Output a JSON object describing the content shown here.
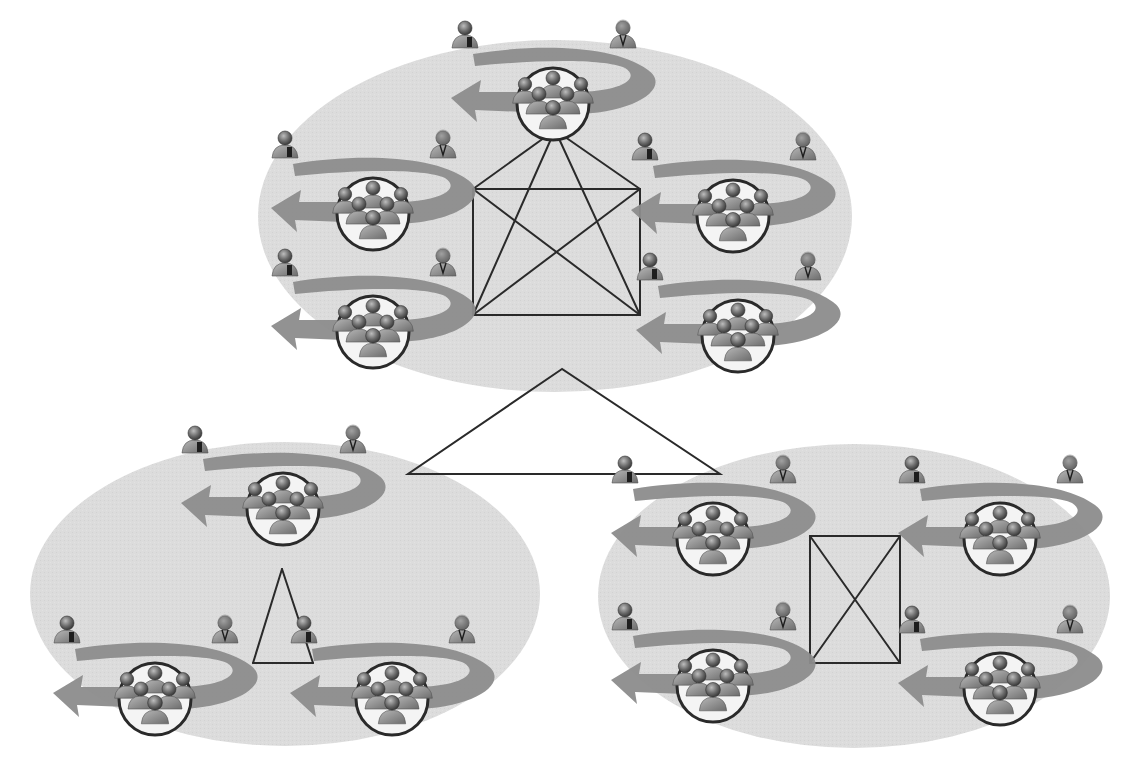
{
  "diagram": {
    "colors": {
      "background": "#ffffff",
      "cluster_fill": "#dcdcdc",
      "arrow": "#8c8c8c",
      "line": "#2a2a2a",
      "node_circle_fill": "#f4f4f4",
      "node_circle_stroke": "#2a2a2a",
      "person_body": "#9a9a9a",
      "person_head": "#6e6e6e"
    },
    "top_link": {
      "shape": "triangle",
      "points": [
        [
          562,
          369
        ],
        [
          408,
          474
        ],
        [
          720,
          474
        ]
      ]
    },
    "clusters": [
      {
        "id": "top-cluster",
        "ellipse": {
          "cx": 555,
          "cy": 216,
          "rx": 297,
          "ry": 176
        },
        "topology": "complete-graph-5",
        "nodes": [
          {
            "id": "T1",
            "cx": 553,
            "cy": 100
          },
          {
            "id": "T2",
            "cx": 373,
            "cy": 210
          },
          {
            "id": "T3",
            "cx": 733,
            "cy": 212
          },
          {
            "id": "T4",
            "cx": 373,
            "cy": 328
          },
          {
            "id": "T5",
            "cx": 738,
            "cy": 332
          }
        ],
        "lines": [
          [
            473,
            189,
            640,
            189
          ],
          [
            640,
            189,
            640,
            315
          ],
          [
            640,
            315,
            473,
            315
          ],
          [
            473,
            315,
            473,
            189
          ],
          [
            473,
            189,
            640,
            315
          ],
          [
            640,
            189,
            473,
            315
          ],
          [
            555,
            130,
            473,
            189
          ],
          [
            555,
            130,
            640,
            189
          ],
          [
            555,
            130,
            473,
            315
          ],
          [
            555,
            130,
            640,
            315
          ]
        ]
      },
      {
        "id": "bottom-left-cluster",
        "ellipse": {
          "cx": 285,
          "cy": 594,
          "rx": 255,
          "ry": 152
        },
        "topology": "triangle-3",
        "nodes": [
          {
            "id": "L1",
            "cx": 283,
            "cy": 505
          },
          {
            "id": "L2",
            "cx": 155,
            "cy": 695
          },
          {
            "id": "L3",
            "cx": 392,
            "cy": 695
          }
        ],
        "lines": [
          [
            282,
            569,
            253,
            663
          ],
          [
            253,
            663,
            313,
            663
          ],
          [
            313,
            663,
            282,
            569
          ]
        ]
      },
      {
        "id": "bottom-right-cluster",
        "ellipse": {
          "cx": 854,
          "cy": 596,
          "rx": 256,
          "ry": 152
        },
        "topology": "complete-graph-4",
        "nodes": [
          {
            "id": "R1",
            "cx": 713,
            "cy": 535
          },
          {
            "id": "R2",
            "cx": 1000,
            "cy": 535
          },
          {
            "id": "R3",
            "cx": 713,
            "cy": 682
          },
          {
            "id": "R4",
            "cx": 1000,
            "cy": 685
          }
        ],
        "lines": [
          [
            810,
            536,
            900,
            536
          ],
          [
            900,
            536,
            900,
            663
          ],
          [
            900,
            663,
            810,
            663
          ],
          [
            810,
            663,
            810,
            536
          ],
          [
            810,
            536,
            900,
            663
          ],
          [
            900,
            536,
            810,
            663
          ]
        ]
      }
    ],
    "node_glyph": {
      "parts": [
        "curved-arrow-ring",
        "person-with-laptop-icon",
        "person-with-tie-icon",
        "circled-group-of-six-people"
      ],
      "circle_radius": 36
    }
  }
}
